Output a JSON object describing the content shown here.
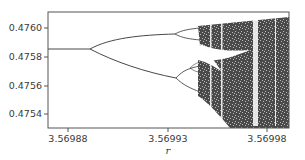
{
  "chart_data": {
    "type": "scatter",
    "title": "",
    "subtitle": "Bifurcation diagram (period-doubling cascade into chaos)",
    "xlabel": "r",
    "ylabel": "",
    "xlim": [
      3.56986,
      3.56999
    ],
    "ylim": [
      0.47533,
      0.47614
    ],
    "x_ticks": [
      3.56988,
      3.56993,
      3.56998
    ],
    "x_tick_labels": [
      "3.56988",
      "3.56993",
      "3.56998"
    ],
    "y_ticks": [
      0.476,
      0.4758,
      0.4756,
      0.4754
    ],
    "y_tick_labels": [
      "0.4760",
      "0.4758",
      "0.4756",
      "0.4754"
    ],
    "grid": false,
    "legend": null,
    "features": {
      "fixed_branch": {
        "r_start": 3.56986,
        "r_end": 3.569896,
        "x": 0.47585
      },
      "first_bifurcation": {
        "r": 3.569896,
        "x": 0.47585
      },
      "branches_after_first": {
        "upper_at_r_3_569935": 0.47597,
        "lower_at_r_3_569935": 0.47565
      },
      "second_bifurcation": [
        {
          "r": 3.569939,
          "x": 0.47597
        },
        {
          "r": 3.56994,
          "x": 0.47565
        }
      ],
      "chaos_onset_r": 3.569945,
      "chaotic_band_range_at_right_edge": [
        0.47537,
        0.47601
      ],
      "periodic_windows_r": [
        3.569952,
        3.569962,
        3.569974,
        3.56999
      ]
    }
  }
}
